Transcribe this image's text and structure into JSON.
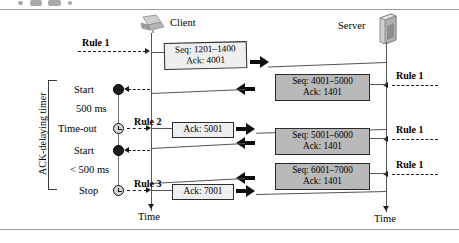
{
  "figure": {
    "endpoints": {
      "client_label": "Client",
      "server_label": "Server",
      "client_time_label": "Time",
      "server_time_label": "Time"
    },
    "timer_group_label": "ACK-delaying timer",
    "timer_events": [
      {
        "id": "start-1",
        "label": "Start",
        "marker": "filled-dot"
      },
      {
        "id": "interval-1",
        "label": "500 ms",
        "marker": "none"
      },
      {
        "id": "timeout-1",
        "label": "Time-out",
        "marker": "clock"
      },
      {
        "id": "start-2",
        "label": "Start",
        "marker": "filled-dot"
      },
      {
        "id": "interval-2",
        "label": "< 500 ms",
        "marker": "none"
      },
      {
        "id": "stop-1",
        "label": "Stop",
        "marker": "clock"
      }
    ],
    "client_rules": [
      {
        "id": "client-rule-1",
        "label": "Rule 1"
      },
      {
        "id": "client-rule-2",
        "label": "Rule 2"
      },
      {
        "id": "client-rule-3",
        "label": "Rule 3"
      }
    ],
    "server_rules": [
      {
        "id": "server-rule-1",
        "label": "Rule 1"
      },
      {
        "id": "server-rule-2",
        "label": "Rule 1"
      },
      {
        "id": "server-rule-3",
        "label": "Rule 1"
      },
      {
        "id": "server-rule-4",
        "label": "Rule 1"
      }
    ],
    "segments": [
      {
        "id": "seg-client-1",
        "direction": "client-to-server",
        "style": "white",
        "seq": "Seq: 1201–1400",
        "ack": "Ack: 4001"
      },
      {
        "id": "seg-server-1",
        "direction": "server-to-client",
        "style": "grey",
        "seq": "Seq: 4001–5000",
        "ack": "Ack: 1401"
      },
      {
        "id": "seg-client-2",
        "direction": "client-to-server",
        "style": "white",
        "seq": "Ack: 5001",
        "ack": ""
      },
      {
        "id": "seg-server-2",
        "direction": "server-to-client",
        "style": "grey",
        "seq": "Seq: 5001–6000",
        "ack": "Ack: 1401"
      },
      {
        "id": "seg-server-3",
        "direction": "server-to-client",
        "style": "grey",
        "seq": "Seq: 6001–7000",
        "ack": "Ack: 1401"
      },
      {
        "id": "seg-client-3",
        "direction": "client-to-server",
        "style": "white",
        "seq": "Ack: 7001",
        "ack": ""
      }
    ],
    "colors": {
      "segment_grey": "#b9b9b9",
      "segment_white": "#efefef",
      "line": "#555555",
      "arrow": "#0d0d0d",
      "rule_line": "#9a9a9a"
    },
    "icons": {
      "client": "laptop-icon",
      "server": "server-tower-icon"
    }
  }
}
